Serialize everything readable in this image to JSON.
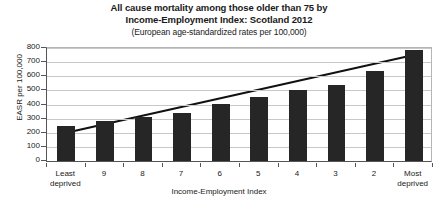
{
  "chart_data": {
    "type": "bar",
    "title": "All cause mortality among those older than 75 by Income-Employment Index: Scotland 2012",
    "title_lines": [
      "All cause mortality among those older than 75 by",
      "Income-Employment Index: Scotland 2012"
    ],
    "subtitle": "(European age-standardized rates per 100,000)",
    "xlabel": "Income-Employment Index",
    "ylabel": "EASR per 100,000",
    "categories": [
      "Least\ndeprived",
      "9",
      "8",
      "7",
      "6",
      "5",
      "4",
      "3",
      "2",
      "Most\ndeprived"
    ],
    "category_labels": [
      "Least deprived",
      "9",
      "8",
      "7",
      "6",
      "5",
      "4",
      "3",
      "2",
      "Most deprived"
    ],
    "values": [
      250,
      280,
      310,
      340,
      405,
      450,
      505,
      540,
      635,
      785
    ],
    "ylim": [
      0,
      800
    ],
    "yticks": [
      0,
      100,
      200,
      300,
      400,
      500,
      600,
      700,
      800
    ],
    "ytick_labels": [
      "0",
      "100",
      "200",
      "300",
      "400",
      "500",
      "600",
      "700",
      "800"
    ],
    "grid": true,
    "legend": "none",
    "series": [
      {
        "name": "EASR per 100,000",
        "type": "bar",
        "color": "#262626",
        "values": [
          250,
          280,
          310,
          340,
          405,
          450,
          505,
          540,
          635,
          785
        ]
      },
      {
        "name": "trend line",
        "type": "line",
        "color": "#111111",
        "endpoints": [
          200,
          750
        ]
      }
    ]
  },
  "style": {
    "bar_color": "#262626",
    "trend_color": "#111111",
    "grid_color": "#c8c8c8",
    "axis_color": "#555555",
    "background": "#ffffff"
  }
}
